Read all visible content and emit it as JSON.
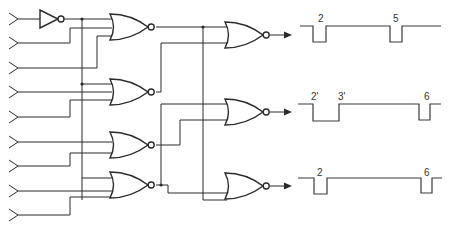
{
  "diagram": {
    "colors": {
      "line": "#2a2a2a",
      "background": "#ffffff"
    },
    "inputs": [
      {
        "y": 19
      },
      {
        "y": 43
      },
      {
        "y": 68
      },
      {
        "y": 92
      },
      {
        "y": 117
      },
      {
        "y": 142
      },
      {
        "y": 166
      },
      {
        "y": 191
      },
      {
        "y": 215
      }
    ],
    "inverter": {
      "x": 40,
      "y": 19
    },
    "stage1_gates": [
      {
        "id": "G1",
        "x": 110,
        "y": 27
      },
      {
        "id": "G2",
        "x": 110,
        "y": 92
      },
      {
        "id": "G3",
        "x": 110,
        "y": 145
      },
      {
        "id": "G4",
        "x": 110,
        "y": 185
      }
    ],
    "stage2_gates": [
      {
        "id": "H1",
        "x": 225,
        "y": 35
      },
      {
        "id": "H2",
        "x": 225,
        "y": 112
      },
      {
        "id": "H3",
        "x": 225,
        "y": 186
      }
    ],
    "waveforms": [
      {
        "name": "output-1",
        "labels": [
          {
            "text": "2",
            "x": 318,
            "y": 22
          },
          {
            "text": "5",
            "x": 393,
            "y": 22
          }
        ],
        "points": "300,26 313,26 313,42 326,42 326,26 390,26 390,42 402,42 402,26 441,26"
      },
      {
        "name": "output-2",
        "labels": [
          {
            "text": "2'",
            "x": 311,
            "y": 100
          },
          {
            "text": "3'",
            "x": 338,
            "y": 100
          }
        ],
        "labels2": [
          {
            "text": "6",
            "x": 424,
            "y": 100
          }
        ],
        "points": "298,104 313,104 313,121 339,121 339,104 419,104 419,120 430,120 430,104 441,104"
      },
      {
        "name": "output-3",
        "labels": [
          {
            "text": "2",
            "x": 317,
            "y": 176
          },
          {
            "text": "6",
            "x": 424,
            "y": 176
          }
        ],
        "points": "298,178 314,178 314,194 327,194 327,178 421,178 421,193 432,193 432,178 442,178"
      }
    ]
  }
}
